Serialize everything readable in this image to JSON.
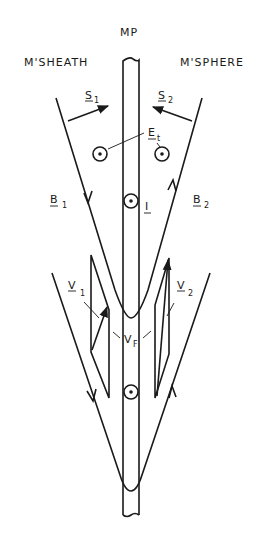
{
  "diagram": {
    "labels": {
      "mp": "MP",
      "magnetosheath": "M'SHEATH",
      "magnetosphere": "M'SPHERE",
      "s1": "S",
      "s1_sub": "1",
      "s2": "S",
      "s2_sub": "2",
      "et": "E",
      "et_sub": "t",
      "b1": "B",
      "b1_sub": "1",
      "b2": "B",
      "b2_sub": "2",
      "current": "I",
      "v1": "V",
      "v1_sub": "1",
      "v2": "V",
      "v2_sub": "2",
      "vf": "V",
      "vf_sub": "F"
    },
    "colors": {
      "ink": "#1a1a1a",
      "background": "#ffffff"
    }
  }
}
